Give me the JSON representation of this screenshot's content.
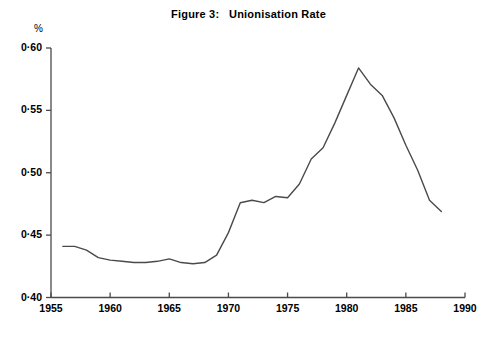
{
  "figure": {
    "title": "Figure 3:   Unionisation Rate",
    "y_unit": "%"
  },
  "axes": {
    "y_ticks": [
      "0·60",
      "0·55",
      "0·50",
      "0·45",
      "0·40"
    ],
    "x_ticks": [
      "1955",
      "1960",
      "1965",
      "1970",
      "1975",
      "1980",
      "1985",
      "1990"
    ]
  },
  "chart_data": {
    "type": "line",
    "title": "Figure 3:   Unionisation Rate",
    "xlabel": "",
    "ylabel": "%",
    "xlim": [
      1955,
      1990
    ],
    "ylim": [
      0.4,
      0.6
    ],
    "grid": false,
    "legend": null,
    "y_tick_values": [
      0.6,
      0.55,
      0.5,
      0.45,
      0.4
    ],
    "y_tick_labels": [
      "0·60",
      "0·55",
      "0·50",
      "0·45",
      "0·40"
    ],
    "x_tick_values": [
      1955,
      1960,
      1965,
      1970,
      1975,
      1980,
      1985,
      1990
    ],
    "x_tick_labels": [
      "1955",
      "1960",
      "1965",
      "1970",
      "1975",
      "1980",
      "1985",
      "1990"
    ],
    "series": [
      {
        "name": "Unionisation Rate",
        "color": "#4a4a4a",
        "x": [
          1956,
          1957,
          1958,
          1959,
          1960,
          1961,
          1962,
          1963,
          1964,
          1965,
          1966,
          1967,
          1968,
          1969,
          1970,
          1971,
          1972,
          1973,
          1974,
          1975,
          1976,
          1977,
          1978,
          1979,
          1980,
          1981,
          1982,
          1983,
          1984,
          1985,
          1986,
          1987,
          1988
        ],
        "y": [
          0.441,
          0.441,
          0.438,
          0.432,
          0.43,
          0.429,
          0.428,
          0.428,
          0.429,
          0.431,
          0.428,
          0.427,
          0.428,
          0.434,
          0.452,
          0.476,
          0.478,
          0.476,
          0.481,
          0.48,
          0.491,
          0.511,
          0.52,
          0.54,
          0.562,
          0.584,
          0.571,
          0.562,
          0.544,
          0.522,
          0.502,
          0.478,
          0.469
        ]
      }
    ]
  },
  "plot_geometry": {
    "x_pixel_1955": 51,
    "x_pixel_1990": 465,
    "y_pixel_060": 48,
    "y_pixel_040": 297.5,
    "tick_length": 5
  }
}
